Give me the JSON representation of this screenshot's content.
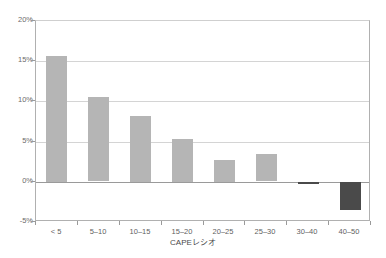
{
  "chart_data": {
    "type": "bar",
    "title": "",
    "xlabel": "CAPEレシオ",
    "ylabel": "",
    "categories": [
      "< 5",
      "5–10",
      "10–15",
      "15–20",
      "20–25",
      "25–30",
      "30–40",
      "40–50"
    ],
    "values": [
      15.7,
      10.5,
      8.2,
      5.3,
      2.7,
      3.4,
      -0.3,
      -3.5
    ],
    "value_format": "percent",
    "ylim": [
      -5,
      20
    ],
    "ytick_values": [
      20,
      15,
      10,
      5,
      0,
      -5
    ],
    "ytick_labels": [
      "20%",
      "15%",
      "10%",
      "5%",
      "0%",
      "-5%"
    ],
    "grid": true,
    "legend": "none",
    "colors": {
      "positive_bar": "#b5b5b5",
      "negative_bar": "#4a4a4a",
      "gridline": "#d4d4d4",
      "zero_line": "#9a9a9a",
      "axis": "#b0b0b0",
      "text": "#5a5a5a",
      "background": "#ffffff"
    }
  }
}
